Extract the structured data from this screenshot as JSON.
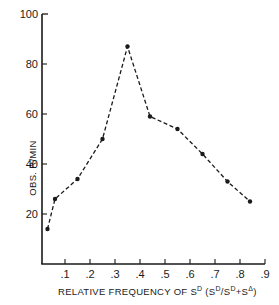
{
  "chart_data": {
    "type": "line",
    "title": "",
    "xlabel": "RELATIVE FREQUENCY OF S^D (S^D/S^D+S^Δ)",
    "ylabel": "OBS. R/MIN",
    "xlim": [
      0,
      0.9
    ],
    "ylim": [
      0,
      100
    ],
    "grid": false,
    "legend": null,
    "line_style": "dashed",
    "marker": "filled-circle",
    "x_ticks": [
      ".1",
      ".2",
      ".3",
      ".4",
      ".5",
      ".6",
      ".7",
      ".8",
      ".9"
    ],
    "y_ticks": [
      "20",
      "40",
      "60",
      "80",
      "100"
    ],
    "series": [
      {
        "name": "Observed responses per minute",
        "x": [
          0.03,
          0.06,
          0.15,
          0.25,
          0.35,
          0.44,
          0.55,
          0.65,
          0.75,
          0.84
        ],
        "y": [
          14,
          26,
          34,
          50,
          87,
          59,
          54,
          44,
          33,
          25
        ]
      }
    ]
  },
  "axes": {
    "xlabel_main": "RELATIVE FREQUENCY OF S",
    "xlabel_sup": "D",
    "xlabel_paren_open": " (S",
    "xlabel_paren_sup1": "D",
    "xlabel_paren_mid": "/S",
    "xlabel_paren_sup2": "D",
    "xlabel_paren_plus": "+S",
    "xlabel_paren_sup3": "Δ",
    "xlabel_paren_close": ")",
    "ylabel": "OBS.  R/MIN"
  },
  "colors": {
    "ink": "#1a1a1a",
    "background": "#ffffff"
  }
}
